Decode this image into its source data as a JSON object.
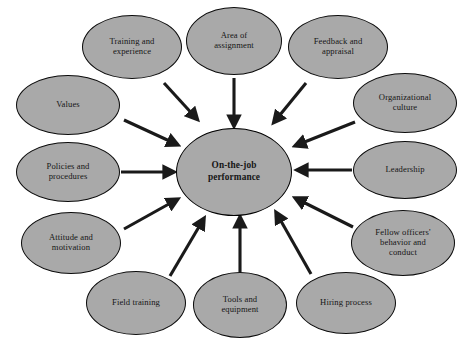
{
  "diagram": {
    "background_color": "#ffffff",
    "node_fill_color": "#a9a9a9",
    "node_border_color": "#0b0b0b",
    "arrow_color": "#1a1a1a",
    "center": {
      "label": "On-the-job performance",
      "line1": "On-the-job",
      "line2": "performance",
      "cx": 234,
      "cy": 172,
      "rx": 58,
      "ry": 44
    },
    "satellites": [
      {
        "id": "training-and-experience",
        "label": "Training and experience",
        "line1": "Training and",
        "line2": "experience",
        "cx": 132,
        "cy": 47,
        "rx": 50,
        "ry": 32,
        "arrow": {
          "x1": 164,
          "y1": 83,
          "x2": 196,
          "y2": 118
        }
      },
      {
        "id": "area-of-assignment",
        "label": "Area of assignment",
        "line1": "Area of",
        "line2": "assignment",
        "cx": 234,
        "cy": 41,
        "rx": 48,
        "ry": 34,
        "arrow": {
          "x1": 234,
          "y1": 78,
          "x2": 234,
          "y2": 124
        }
      },
      {
        "id": "feedback-and-appraisal",
        "label": "Feedback and appraisal",
        "line1": "Feedback and",
        "line2": "appraisal",
        "cx": 338,
        "cy": 47,
        "rx": 50,
        "ry": 32,
        "arrow": {
          "x1": 306,
          "y1": 83,
          "x2": 275,
          "y2": 121
        }
      },
      {
        "id": "organizational-culture",
        "label": "Organizational culture",
        "line1": "Organizational",
        "line2": "culture",
        "cx": 405,
        "cy": 103,
        "rx": 52,
        "ry": 30,
        "arrow": {
          "x1": 355,
          "y1": 122,
          "x2": 297,
          "y2": 145
        }
      },
      {
        "id": "leadership",
        "label": "Leadership",
        "line1": "Leadership",
        "line2": "",
        "cx": 405,
        "cy": 170,
        "rx": 52,
        "ry": 29,
        "arrow": {
          "x1": 352,
          "y1": 170,
          "x2": 299,
          "y2": 170
        }
      },
      {
        "id": "fellow-officers-behavior-and-conduct",
        "label": "Fellow officers' behavior and conduct",
        "line1": "Fellow officers'",
        "line2": "behavior and",
        "line3": "conduct",
        "cx": 403,
        "cy": 243,
        "rx": 52,
        "ry": 33,
        "arrow": {
          "x1": 353,
          "y1": 227,
          "x2": 297,
          "y2": 199
        }
      },
      {
        "id": "hiring-process",
        "label": "Hiring process",
        "line1": "Hiring process",
        "line2": "",
        "cx": 346,
        "cy": 303,
        "rx": 50,
        "ry": 31,
        "arrow": {
          "x1": 311,
          "y1": 274,
          "x2": 277,
          "y2": 214
        }
      },
      {
        "id": "tools-and-equipment",
        "label": "Tools and equipment",
        "line1": "Tools and",
        "line2": "equipment",
        "cx": 240,
        "cy": 305,
        "rx": 47,
        "ry": 33,
        "arrow": {
          "x1": 240,
          "y1": 272,
          "x2": 240,
          "y2": 219
        }
      },
      {
        "id": "field-training",
        "label": "Field training",
        "line1": "Field training",
        "line2": "",
        "cx": 136,
        "cy": 303,
        "rx": 50,
        "ry": 32,
        "arrow": {
          "x1": 170,
          "y1": 276,
          "x2": 203,
          "y2": 220
        }
      },
      {
        "id": "attitude-and-motivation",
        "label": "Attitude and motivation",
        "line1": "Attitude and",
        "line2": "motivation",
        "cx": 71,
        "cy": 243,
        "rx": 50,
        "ry": 31,
        "arrow": {
          "x1": 124,
          "y1": 229,
          "x2": 176,
          "y2": 200
        }
      },
      {
        "id": "policies-and-procedures",
        "label": "Policies and procedures",
        "line1": "Policies and",
        "line2": "procedures",
        "cx": 68,
        "cy": 172,
        "rx": 52,
        "ry": 30,
        "arrow": {
          "x1": 121,
          "y1": 172,
          "x2": 172,
          "y2": 172
        }
      },
      {
        "id": "values",
        "label": "Values",
        "line1": "Values",
        "line2": "",
        "cx": 68,
        "cy": 105,
        "rx": 52,
        "ry": 30,
        "arrow": {
          "x1": 124,
          "y1": 120,
          "x2": 176,
          "y2": 144
        }
      }
    ]
  }
}
